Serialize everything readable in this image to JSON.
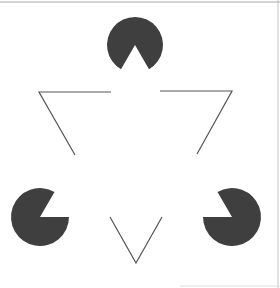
{
  "figure": {
    "background": "#ffffff",
    "border_color": "#a8a8a8",
    "fill_color": "#3f3f3f",
    "line_color": "#555555",
    "pacmen": [
      {
        "name": "top",
        "cx": 135,
        "cy": 45,
        "r": 28,
        "mouth_direction_deg": 90
      },
      {
        "name": "bottom-left",
        "cx": 40,
        "cy": 217,
        "r": 29,
        "mouth_direction_deg": -30
      },
      {
        "name": "bottom-right",
        "cx": 232,
        "cy": 217,
        "r": 29,
        "mouth_direction_deg": 210
      }
    ],
    "outline_segments": [
      {
        "name": "left-corner",
        "points": [
          [
            111,
            92
          ],
          [
            39,
            92
          ],
          [
            75,
            155
          ]
        ]
      },
      {
        "name": "right-corner",
        "points": [
          [
            160,
            91
          ],
          [
            232,
            91
          ],
          [
            197,
            154
          ]
        ]
      },
      {
        "name": "bottom-corner",
        "points": [
          [
            110,
            217
          ],
          [
            136,
            263
          ],
          [
            162,
            217
          ]
        ]
      }
    ]
  }
}
